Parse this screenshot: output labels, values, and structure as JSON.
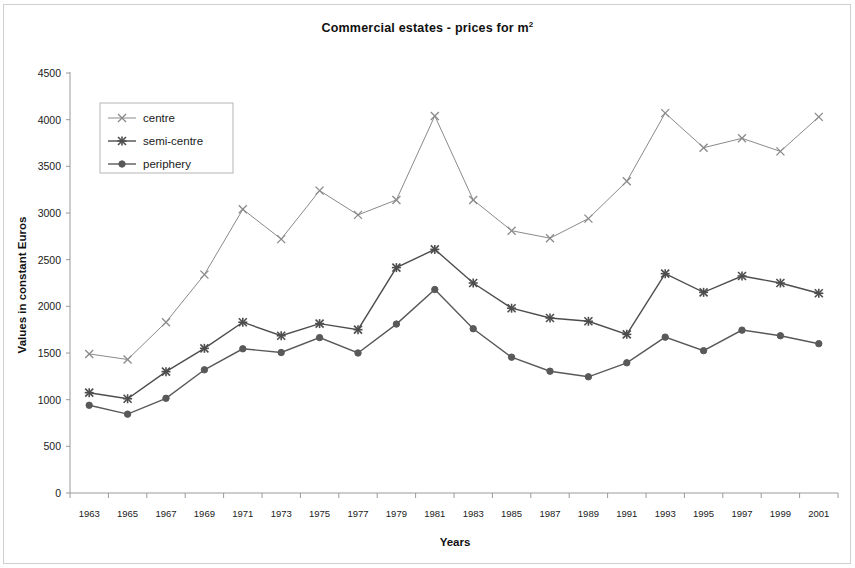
{
  "figure": {
    "title_main": "Commercial estates - prices for m",
    "title_sup": "2",
    "background": "#ffffff",
    "frame_color": "#cfcfcf"
  },
  "chart_data": {
    "type": "line",
    "title": "Commercial estates - prices for m2",
    "xlabel": "Years",
    "ylabel": "Values in constant Euros",
    "grid": false,
    "legend_position": "upper-left-inside",
    "ylim": [
      0,
      4500
    ],
    "ytick_step": 500,
    "yticks": [
      0,
      500,
      1000,
      1500,
      2000,
      2500,
      3000,
      3500,
      4000,
      4500
    ],
    "ytick_labels": [
      "0",
      "500",
      "1000",
      "1500",
      "2000",
      "2500",
      "3000",
      "3500",
      "4000",
      "4500"
    ],
    "categories": [
      1963,
      1965,
      1967,
      1969,
      1971,
      1973,
      1975,
      1977,
      1979,
      1981,
      1983,
      1985,
      1987,
      1989,
      1991,
      1993,
      1995,
      1997,
      1999,
      2001
    ],
    "xtick_labels": [
      "1963",
      "1965",
      "1967",
      "1969",
      "1971",
      "1973",
      "1975",
      "1977",
      "1979",
      "1981",
      "1983",
      "1985",
      "1987",
      "1989",
      "1991",
      "1993",
      "1995",
      "1997",
      "1999",
      "2001"
    ],
    "series": [
      {
        "name": "centre",
        "marker": "x",
        "color": "#8a8a8a",
        "values": [
          1490,
          1430,
          1830,
          2340,
          3040,
          2720,
          3240,
          2980,
          3140,
          4040,
          3140,
          2810,
          2730,
          2940,
          3340,
          4070,
          3700,
          3800,
          3660,
          4030
        ]
      },
      {
        "name": "semi-centre",
        "marker": "star",
        "color": "#4d4d4d",
        "values": [
          1075,
          1010,
          1300,
          1550,
          1830,
          1685,
          1815,
          1750,
          2415,
          2610,
          2250,
          1980,
          1875,
          1840,
          1700,
          2350,
          2150,
          2325,
          2250,
          2140
        ]
      },
      {
        "name": "periphery",
        "marker": "circle",
        "color": "#595959",
        "values": [
          940,
          845,
          1015,
          1320,
          1545,
          1505,
          1665,
          1500,
          1810,
          2180,
          1760,
          1455,
          1305,
          1245,
          1395,
          1670,
          1525,
          1745,
          1685,
          1600
        ]
      }
    ]
  },
  "legend": {
    "items": [
      {
        "label": "centre"
      },
      {
        "label": "semi-centre"
      },
      {
        "label": "periphery"
      }
    ]
  }
}
